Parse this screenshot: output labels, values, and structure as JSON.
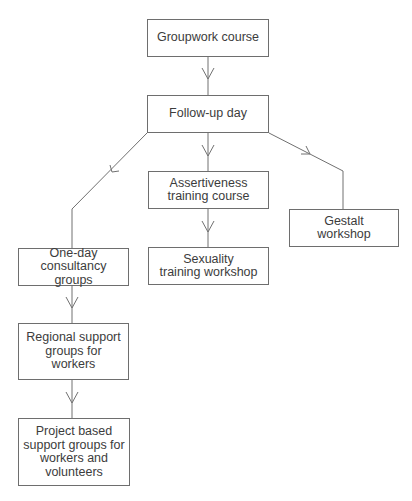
{
  "diagram": {
    "type": "flowchart",
    "nodes": [
      {
        "id": "groupwork",
        "label": "Groupwork course"
      },
      {
        "id": "followup",
        "label": "Follow-up day"
      },
      {
        "id": "assertiveness",
        "label": "Assertiveness\ntraining course"
      },
      {
        "id": "gestalt",
        "label": "Gestalt\nworkshop"
      },
      {
        "id": "oneday",
        "label": "One-day\nconsultancy groups"
      },
      {
        "id": "sexuality",
        "label": "Sexuality\ntraining workshop"
      },
      {
        "id": "regional",
        "label": "Regional support\ngroups for\nworkers"
      },
      {
        "id": "project",
        "label": "Project based\nsupport groups for\nworkers and\nvolunteers"
      }
    ],
    "edges": [
      {
        "from": "groupwork",
        "to": "followup"
      },
      {
        "from": "followup",
        "to": "oneday"
      },
      {
        "from": "followup",
        "to": "assertiveness"
      },
      {
        "from": "followup",
        "to": "gestalt"
      },
      {
        "from": "assertiveness",
        "to": "sexuality"
      },
      {
        "from": "oneday",
        "to": "regional"
      },
      {
        "from": "regional",
        "to": "project"
      }
    ]
  }
}
